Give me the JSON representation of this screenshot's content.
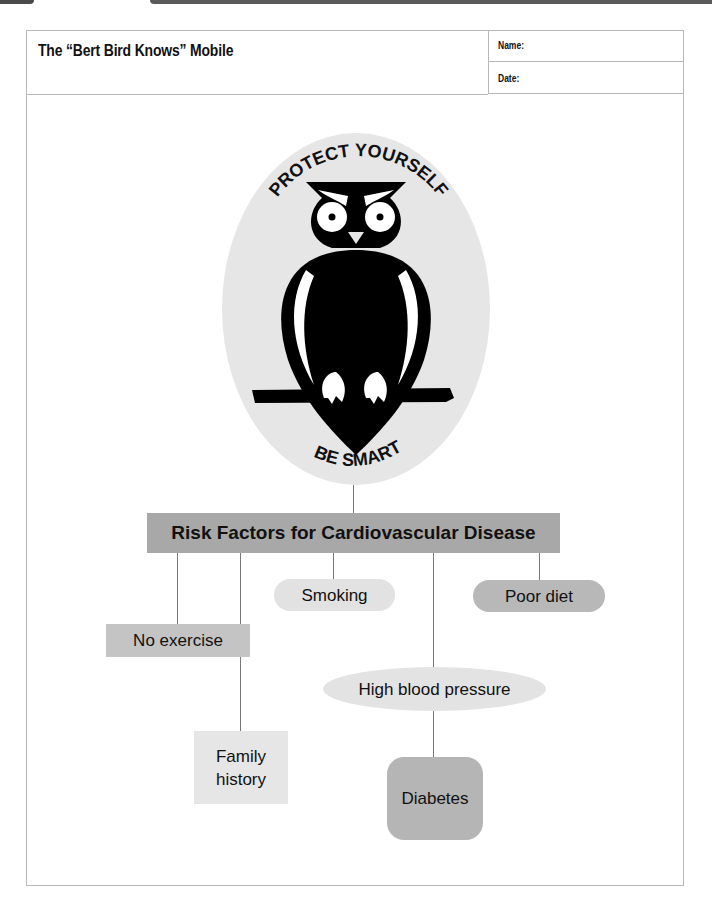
{
  "header": {
    "worksheet_label": "Worksheet 15.1",
    "title": "The “Bert Bird Knows” Mobile",
    "name_label": "Name:",
    "date_label": "Date:"
  },
  "emblem": {
    "top_text": "PROTECT YOURSELF",
    "bottom_text": "BE SMART",
    "icon": "owl-icon"
  },
  "diagram": {
    "main": "Risk Factors for Cardiovascular Disease",
    "nodes": {
      "smoking": "Smoking",
      "poor_diet": "Poor diet",
      "no_exercise": "No exercise",
      "high_blood_pressure": "High blood pressure",
      "family_history_line1": "Family",
      "family_history_line2": "history",
      "diabetes": "Diabetes"
    }
  },
  "colors": {
    "main_box": "#a8a8a8",
    "light_node": "#e2e2e2",
    "mid_node": "#b8b8b8",
    "emblem_bg": "#e6e6e6",
    "owl": "#000000"
  }
}
